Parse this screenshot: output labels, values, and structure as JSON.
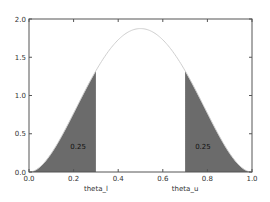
{
  "chart_data": {
    "type": "area",
    "title": "",
    "xlabel": "",
    "ylabel": "",
    "xlim": [
      0.0,
      1.0
    ],
    "ylim": [
      0.0,
      2.0
    ],
    "grid": false,
    "curve": "Beta(3,3) pdf: 30*x^2*(1-x)^2",
    "x_ticks": [
      "0.0",
      "0.2",
      "0.4",
      "0.6",
      "0.8",
      "1.0"
    ],
    "y_ticks": [
      "0.0",
      "0.5",
      "1.0",
      "1.5",
      "2.0"
    ],
    "shaded_regions": [
      {
        "from": 0.0,
        "to": 0.3,
        "area_label": "0.25"
      },
      {
        "from": 0.7,
        "to": 1.0,
        "area_label": "0.25"
      }
    ],
    "x_annotations": [
      {
        "x": 0.3,
        "label": "theta_l"
      },
      {
        "x": 0.7,
        "label": "theta_u"
      }
    ],
    "peak": {
      "x": 0.5,
      "y": 1.875
    }
  }
}
